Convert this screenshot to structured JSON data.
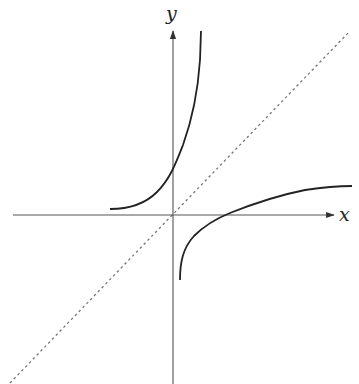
{
  "diagram": {
    "axes": {
      "x_label": "x",
      "y_label": "y",
      "color": "#555555"
    },
    "curves": [
      {
        "name": "exponential",
        "description": "increasing curve, left asymptote near the x-axis, rising steeply",
        "color": "#222222"
      },
      {
        "name": "logarithm",
        "description": "increasing curve, vertical asymptote near the y-axis, crosses the x-axis at positive x",
        "color": "#222222"
      }
    ],
    "reflection_line": {
      "name": "y = x",
      "style": "dashed",
      "color": "#777777"
    }
  }
}
